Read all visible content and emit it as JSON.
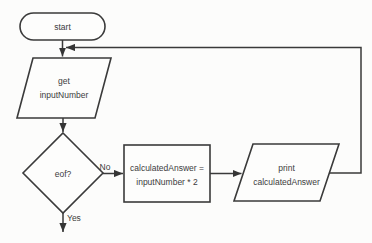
{
  "flowchart": {
    "colors": {
      "background": "#fcfcfb",
      "line": "#3a3a3a",
      "text": "#3c3c3c"
    },
    "nodes": {
      "start": {
        "shape": "terminal-rounded",
        "label": "start"
      },
      "get_input": {
        "shape": "io-parallelogram",
        "line1": "get",
        "line2": "inputNumber"
      },
      "eof_decision": {
        "shape": "decision-diamond",
        "label": "eof?"
      },
      "calculate": {
        "shape": "process-rectangle",
        "line1": "calculatedAnswer =",
        "line2": "inputNumber * 2"
      },
      "print_output": {
        "shape": "io-parallelogram",
        "line1": "print",
        "line2": "calculatedAnswer"
      }
    },
    "branch_labels": {
      "no": "No",
      "yes": "Yes"
    }
  }
}
